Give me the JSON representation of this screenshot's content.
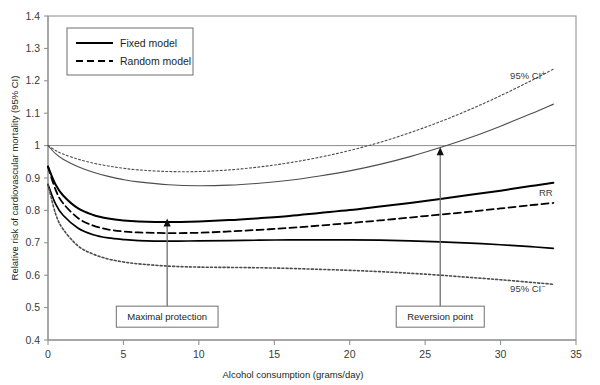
{
  "chart_data": {
    "type": "line",
    "title": "",
    "xlabel": "Alcohol consumption (grams/day)",
    "ylabel": "Relative risk of cardiovascular mortality (95% CI)",
    "xlim": [
      0,
      35
    ],
    "ylim": [
      0.4,
      1.4
    ],
    "xticks": [
      0,
      5,
      10,
      15,
      20,
      25,
      30,
      35
    ],
    "xtick_labels": [
      "0",
      "5",
      "10",
      "15",
      "20",
      "25",
      "30",
      "35"
    ],
    "yticks": [
      0.4,
      0.5,
      0.6,
      0.7,
      0.8,
      0.9,
      1.0,
      1.1,
      1.2,
      1.3,
      1.4
    ],
    "ytick_labels": [
      "0.4",
      "0.5",
      "0.6",
      "0.7",
      "0.8",
      "0.9",
      "1",
      "1.1",
      "1.2",
      "1.3",
      "1.4"
    ],
    "grid": false,
    "reference_line": {
      "y": 1.0,
      "label": "null risk (RR = 1)"
    },
    "legend": {
      "position": "top-left",
      "entries": [
        {
          "label": "Fixed model",
          "style": "solid",
          "color": "#000000"
        },
        {
          "label": "Random model",
          "style": "dashed",
          "color": "#000000"
        }
      ]
    },
    "series": [
      {
        "name": "Fixed model 95% CI upper",
        "label": "95% CI+",
        "style": "solid",
        "color": "#4d4d4d",
        "width": 1.1,
        "x": [
          0,
          0.5,
          1,
          2,
          3,
          4,
          5,
          6,
          8,
          10,
          12,
          14,
          16,
          18,
          20,
          22,
          24,
          26,
          28,
          30,
          32,
          33.5
        ],
        "values": [
          1.0,
          0.975,
          0.958,
          0.935,
          0.918,
          0.905,
          0.895,
          0.888,
          0.879,
          0.876,
          0.878,
          0.884,
          0.893,
          0.906,
          0.922,
          0.942,
          0.966,
          0.994,
          1.025,
          1.06,
          1.098,
          1.128
        ]
      },
      {
        "name": "Random model 95% CI upper",
        "label": "95% CI+",
        "style": "dotted",
        "color": "#4d4d4d",
        "width": 1.1,
        "x": [
          0,
          0.5,
          1,
          2,
          3,
          4,
          5,
          6,
          8,
          10,
          12,
          14,
          16,
          18,
          20,
          22,
          24,
          26,
          28,
          30,
          32,
          33.5
        ],
        "values": [
          1.0,
          0.985,
          0.974,
          0.958,
          0.946,
          0.937,
          0.93,
          0.925,
          0.92,
          0.92,
          0.925,
          0.934,
          0.947,
          0.964,
          0.985,
          1.01,
          1.04,
          1.074,
          1.112,
          1.154,
          1.2,
          1.236
        ]
      },
      {
        "name": "Fixed model RR",
        "label": "RR",
        "style": "solid",
        "color": "#000000",
        "width": 2.0,
        "x": [
          0,
          0.5,
          1,
          2,
          3,
          4,
          5,
          6,
          8,
          10,
          12,
          14,
          16,
          18,
          20,
          22,
          24,
          26,
          28,
          30,
          32,
          33.5
        ],
        "values": [
          0.935,
          0.88,
          0.846,
          0.806,
          0.786,
          0.775,
          0.769,
          0.766,
          0.764,
          0.766,
          0.77,
          0.776,
          0.783,
          0.792,
          0.801,
          0.812,
          0.823,
          0.835,
          0.848,
          0.861,
          0.875,
          0.885
        ]
      },
      {
        "name": "Random model RR",
        "label": "RR",
        "style": "dashed",
        "color": "#000000",
        "width": 1.8,
        "x": [
          0,
          0.5,
          1,
          2,
          3,
          4,
          5,
          6,
          8,
          10,
          12,
          14,
          16,
          18,
          20,
          22,
          24,
          26,
          28,
          30,
          32,
          33.5
        ],
        "values": [
          0.935,
          0.864,
          0.822,
          0.776,
          0.753,
          0.741,
          0.735,
          0.732,
          0.73,
          0.731,
          0.735,
          0.74,
          0.746,
          0.753,
          0.761,
          0.769,
          0.778,
          0.787,
          0.796,
          0.806,
          0.816,
          0.823
        ]
      },
      {
        "name": "Fixed model 95% CI lower",
        "label": "95% CI-",
        "style": "solid",
        "color": "#000000",
        "width": 1.7,
        "x": [
          0,
          0.5,
          1,
          2,
          3,
          4,
          5,
          6,
          8,
          10,
          12,
          14,
          16,
          18,
          20,
          22,
          24,
          26,
          28,
          30,
          32,
          33.5
        ],
        "values": [
          0.88,
          0.82,
          0.785,
          0.745,
          0.725,
          0.715,
          0.71,
          0.707,
          0.705,
          0.706,
          0.707,
          0.708,
          0.709,
          0.709,
          0.709,
          0.708,
          0.706,
          0.703,
          0.699,
          0.694,
          0.688,
          0.683
        ]
      },
      {
        "name": "Random model 95% CI lower",
        "label": "95% CI-",
        "style": "dotted",
        "color": "#4d4d4d",
        "width": 1.6,
        "x": [
          0,
          0.5,
          1,
          2,
          3,
          4,
          5,
          6,
          8,
          10,
          12,
          14,
          16,
          18,
          20,
          22,
          24,
          26,
          28,
          30,
          32,
          33.5
        ],
        "values": [
          0.88,
          0.79,
          0.742,
          0.69,
          0.665,
          0.65,
          0.641,
          0.635,
          0.628,
          0.625,
          0.624,
          0.623,
          0.621,
          0.618,
          0.615,
          0.611,
          0.606,
          0.6,
          0.593,
          0.586,
          0.578,
          0.572
        ]
      }
    ],
    "curve_labels": [
      {
        "name": "ci-upper-label",
        "text": "95% CI",
        "sup": "+",
        "x": 31.8,
        "y": 1.205
      },
      {
        "name": "rr-label",
        "text": "RR",
        "sup": "",
        "x": 33.0,
        "y": 0.845
      },
      {
        "name": "ci-lower-label",
        "text": "95% CI",
        "sup": "−",
        "x": 31.8,
        "y": 0.548
      }
    ],
    "annotations": [
      {
        "name": "maximal-protection",
        "label": "Maximal protection",
        "box_x": 7.9,
        "box_y": 0.472,
        "arrow_from_y": 0.497,
        "arrow_to_y": 0.775,
        "arrow_x": 7.9
      },
      {
        "name": "reversion-point",
        "label": "Reversion point",
        "box_x": 26.0,
        "box_y": 0.472,
        "arrow_from_y": 0.497,
        "arrow_to_y": 0.995,
        "arrow_x": 26.0
      }
    ]
  }
}
